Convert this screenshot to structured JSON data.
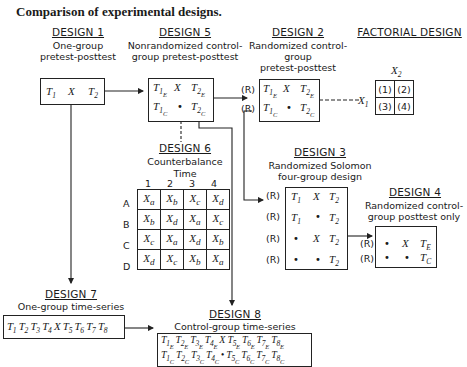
{
  "title": "Comparison of experimental designs.",
  "designs": {
    "d1": {
      "heading": "DESIGN 1",
      "line1": "One-group",
      "line2": "pretest-posttest",
      "cells": [
        "T1",
        "X",
        "T2"
      ]
    },
    "d5": {
      "heading": "DESIGN 5",
      "line1": "Nonrandomized control-",
      "line2": "group pretest-posttest",
      "rows": [
        [
          "T1E",
          "X",
          "T2E"
        ],
        [
          "T1C",
          "•",
          "T2C"
        ]
      ]
    },
    "d2": {
      "heading": "DESIGN 2",
      "line1": "Randomized control-",
      "line2": "group",
      "line3": "pretest-posttest",
      "r_label": "(R)",
      "rows": [
        [
          "T1E",
          "X",
          "T2E"
        ],
        [
          "T1C",
          "•",
          "T2C"
        ]
      ]
    },
    "factorial": {
      "heading": "FACTORIAL DESIGN",
      "x1": "X1",
      "x2": "X2",
      "cells": [
        [
          "(1)",
          "(2)"
        ],
        [
          "(3)",
          "(4)"
        ]
      ]
    },
    "d6": {
      "heading": "DESIGN 6",
      "line1": "Counterbalance",
      "line2": "Time",
      "cols": [
        "1",
        "2",
        "3",
        "4"
      ],
      "rows": [
        {
          "label": "A",
          "cells": [
            "Xa",
            "Xb",
            "Xc",
            "Xd"
          ]
        },
        {
          "label": "B",
          "cells": [
            "Xb",
            "Xd",
            "Xa",
            "Xc"
          ]
        },
        {
          "label": "C",
          "cells": [
            "Xc",
            "Xa",
            "Xd",
            "Xb"
          ]
        },
        {
          "label": "D",
          "cells": [
            "Xd",
            "Xc",
            "Xb",
            "Xa"
          ]
        }
      ]
    },
    "d3": {
      "heading": "DESIGN 3",
      "line1": "Randomized Solomon",
      "line2": "four-group design",
      "r_label": "(R)",
      "rows": [
        [
          "T1",
          "X",
          "T2"
        ],
        [
          "T1",
          "•",
          "T2"
        ],
        [
          "•",
          "X",
          "T2"
        ],
        [
          "•",
          "•",
          "T2"
        ]
      ]
    },
    "d4": {
      "heading": "DESIGN 4",
      "line1": "Randomized control-",
      "line2": "group posttest only",
      "r_label": "(R)",
      "rows": [
        [
          "•",
          "X",
          "TE"
        ],
        [
          "•",
          "•",
          "TC"
        ]
      ]
    },
    "d7": {
      "heading": "DESIGN 7",
      "line1": "One-group time-series",
      "sequence": [
        "T1",
        "T2",
        "T3",
        "T4",
        "X",
        "T5",
        "T6",
        "T7",
        "T8"
      ]
    },
    "d8": {
      "heading": "DESIGN 8",
      "line1": "Control-group time-series",
      "rows": [
        [
          "T1E",
          "T2E",
          "T3E",
          "T4E",
          "X",
          "T5E",
          "T6E",
          "T7E",
          "T8E"
        ],
        [
          "T1C",
          "T2C",
          "T3C",
          "T4C",
          "•",
          "T5C",
          "T6C",
          "T7C",
          "T8C"
        ]
      ]
    }
  }
}
